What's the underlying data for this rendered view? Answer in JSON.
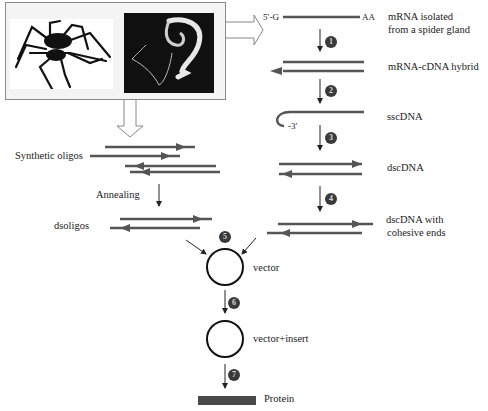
{
  "figure": {
    "images": {
      "left": "spider-drawing",
      "right": "silk-gland-micrograph"
    },
    "cdna_path": {
      "end_5prime": "5′-G",
      "end_polyA": "AA",
      "end_3prime": "-3′",
      "labels": [
        "mRNA isolated",
        "from a spider gland",
        "mRNA-cDNA hybrid",
        "sscDNA",
        "dscDNA",
        "dscDNA with",
        "cohesive ends"
      ]
    },
    "oligo_path": {
      "synthetic_label": "Synthetic oligos",
      "annealing_label": "Annealing",
      "ds_label": "dsoligos"
    },
    "cloning": {
      "vector_label": "vector",
      "vector_insert_label": "vector+insert",
      "protein_label": "Protein"
    },
    "steps": [
      "1",
      "2",
      "3",
      "4",
      "5",
      "6",
      "7"
    ],
    "colors": {
      "strand": "#555555",
      "step_badge": "#3a3a3a",
      "protein_bar": "#4a4a4a",
      "box_border": "#8a8a8a"
    }
  }
}
